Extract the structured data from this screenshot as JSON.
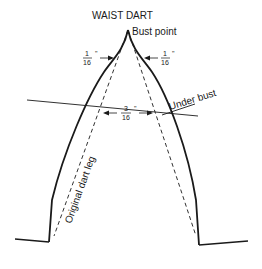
{
  "title": "WAIST DART",
  "labels": {
    "bust_point": "Bust point",
    "under_bust": "Under bust",
    "original_dart_leg": "Original dart leg"
  },
  "measurements": {
    "left_top": {
      "numerator": "1",
      "denominator": "16",
      "unit": "\""
    },
    "right_top": {
      "numerator": "1",
      "denominator": "16",
      "unit": "\""
    },
    "middle": {
      "numerator": "3",
      "denominator": "16",
      "unit": "\""
    }
  },
  "colors": {
    "line": "#1a1a1a",
    "background": "#ffffff"
  }
}
